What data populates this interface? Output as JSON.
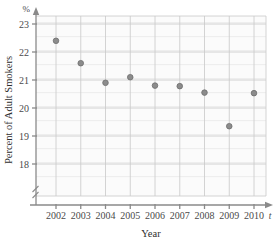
{
  "chart_data": {
    "type": "scatter",
    "title": "",
    "xlabel": "Year",
    "ylabel": "Percent of Adult Smokers",
    "x_unit_symbol": "t",
    "y_unit_symbol": "%",
    "categories": [
      "2002",
      "2003",
      "2004",
      "2005",
      "2006",
      "2007",
      "2008",
      "2009",
      "2010"
    ],
    "x": [
      2002,
      2003,
      2004,
      2005,
      2006,
      2007,
      2008,
      2009,
      2010
    ],
    "values": [
      22.4,
      21.6,
      20.9,
      21.1,
      20.8,
      20.78,
      20.55,
      19.35,
      20.53
    ],
    "xlim": [
      2001.4,
      2010.6
    ],
    "ylim": [
      17.55,
      23.3
    ],
    "y_ticks": [
      18,
      19,
      20,
      21,
      22,
      23
    ],
    "y_tick_labels": [
      "18",
      "19",
      "20",
      "21",
      "22",
      "23"
    ],
    "x_ticks": [
      2002,
      2003,
      2004,
      2005,
      2006,
      2007,
      2008,
      2009,
      2010
    ],
    "grid": true,
    "grid_minor": true,
    "legend": "none",
    "axis_break": true,
    "marker": {
      "shape": "circle",
      "color": "#8c8c8c",
      "edge_color": "#6e6e6e",
      "size": 5
    },
    "colors": {
      "grid_major": "#c9c9c9",
      "grid_minor": "#e6e6e6",
      "axis": "#8a8a8a",
      "text": "#3a3a3a",
      "background": "#ffffff",
      "plot_background": "#fbfbfb"
    }
  }
}
